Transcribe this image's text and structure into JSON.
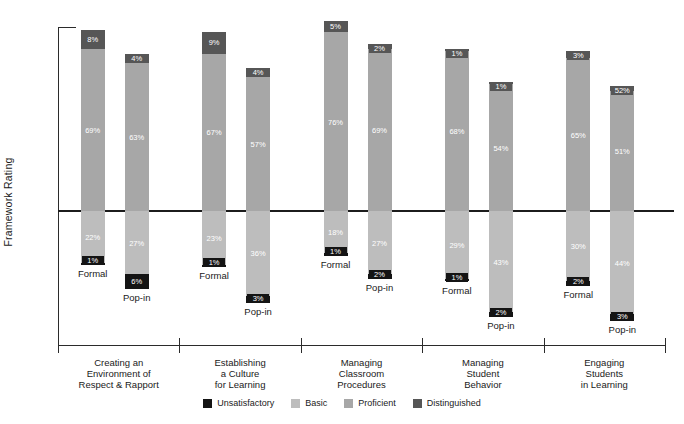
{
  "chart_data": {
    "type": "bar",
    "variant": "diverging-stacked-percent",
    "title": "",
    "ylabel": "Framework Rating",
    "legend": [
      {
        "name": "Unsatisfactory",
        "color": "#141414"
      },
      {
        "name": "Basic",
        "color": "#bdbdbd"
      },
      {
        "name": "Proficient",
        "color": "#a7a7a7"
      },
      {
        "name": "Distinguished",
        "color": "#565656"
      }
    ],
    "bar_types": [
      "Formal",
      "Pop-in"
    ],
    "axis_note": "segments above reference line: Proficient then Distinguished on top; below line: Basic then Unsatisfactory at bottom",
    "groups": [
      {
        "category_lines": [
          "Creating an",
          "Environment of",
          "Respect & Rapport"
        ],
        "bars": [
          {
            "name": "Formal",
            "distinguished": {
              "value": 8,
              "label": "8%"
            },
            "proficient": {
              "value": 69,
              "label": "69%"
            },
            "basic": {
              "value": 22,
              "label": "22%"
            },
            "unsatisfactory": {
              "value": 1,
              "label": "1%"
            }
          },
          {
            "name": "Pop-in",
            "distinguished": {
              "value": 4,
              "label": "4%"
            },
            "proficient": {
              "value": 63,
              "label": "63%"
            },
            "basic": {
              "value": 27,
              "label": "27%"
            },
            "unsatisfactory": {
              "value": 6,
              "label": "6%"
            }
          }
        ]
      },
      {
        "category_lines": [
          "Establishing",
          "a Culture",
          "for Learning"
        ],
        "bars": [
          {
            "name": "Formal",
            "distinguished": {
              "value": 9,
              "label": "9%"
            },
            "proficient": {
              "value": 67,
              "label": "67%"
            },
            "basic": {
              "value": 23,
              "label": "23%"
            },
            "unsatisfactory": {
              "value": 1,
              "label": "1%"
            }
          },
          {
            "name": "Pop-in",
            "distinguished": {
              "value": 4,
              "label": "4%"
            },
            "proficient": {
              "value": 57,
              "label": "57%"
            },
            "basic": {
              "value": 36,
              "label": "36%"
            },
            "unsatisfactory": {
              "value": 3,
              "label": "3%"
            }
          }
        ]
      },
      {
        "category_lines": [
          "Managing",
          "Classroom",
          "Procedures"
        ],
        "bars": [
          {
            "name": "Formal",
            "distinguished": {
              "value": 5,
              "label": "5%"
            },
            "proficient": {
              "value": 76,
              "label": "76%"
            },
            "basic": {
              "value": 18,
              "label": "18%"
            },
            "unsatisfactory": {
              "value": 1,
              "label": "1%"
            }
          },
          {
            "name": "Pop-in",
            "distinguished": {
              "value": 2,
              "label": "2%"
            },
            "proficient": {
              "value": 69,
              "label": "69%"
            },
            "basic": {
              "value": 27,
              "label": "27%"
            },
            "unsatisfactory": {
              "value": 2,
              "label": "2%"
            }
          }
        ]
      },
      {
        "category_lines": [
          "Managing",
          "Student",
          "Behavior"
        ],
        "bars": [
          {
            "name": "Formal",
            "distinguished": {
              "value": 1,
              "label": "1%"
            },
            "proficient": {
              "value": 68,
              "label": "68%"
            },
            "basic": {
              "value": 29,
              "label": "29%"
            },
            "unsatisfactory": {
              "value": 1,
              "label": "1%"
            }
          },
          {
            "name": "Pop-in",
            "distinguished": {
              "value": 1,
              "label": "1%"
            },
            "proficient": {
              "value": 54,
              "label": "54%"
            },
            "basic": {
              "value": 43,
              "label": "43%"
            },
            "unsatisfactory": {
              "value": 2,
              "label": "2%"
            }
          }
        ]
      },
      {
        "category_lines": [
          "Engaging",
          "Students",
          "in Learning"
        ],
        "bars": [
          {
            "name": "Formal",
            "distinguished": {
              "value": 3,
              "label": "3%"
            },
            "proficient": {
              "value": 65,
              "label": "65%"
            },
            "basic": {
              "value": 30,
              "label": "30%"
            },
            "unsatisfactory": {
              "value": 2,
              "label": "2%"
            }
          },
          {
            "name": "Pop-in",
            "distinguished": {
              "value": 2,
              "label": "52%"
            },
            "proficient": {
              "value": 51,
              "label": "51%"
            },
            "basic": {
              "value": 44,
              "label": "44%"
            },
            "unsatisfactory": {
              "value": 3,
              "label": "3%"
            }
          }
        ]
      }
    ]
  }
}
